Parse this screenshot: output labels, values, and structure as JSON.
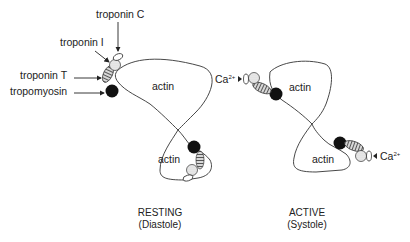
{
  "diagram": {
    "resting": {
      "caption_line1": "RESTING",
      "caption_line2": "(Diastole)",
      "actin_top": "actin",
      "actin_bottom": "actin",
      "labels": {
        "troponin_c": "troponin C",
        "troponin_i": "troponin I",
        "troponin_t": "troponin T",
        "tropomyosin": "tropomyosin"
      }
    },
    "active": {
      "caption_line1": "ACTIVE",
      "caption_line2": "(Systole)",
      "actin_top": "actin",
      "actin_bottom": "actin",
      "calcium_top": "Ca",
      "calcium_top_charge": "2+",
      "calcium_bottom": "Ca",
      "calcium_bottom_charge": "2+"
    },
    "colors": {
      "line": "#333333",
      "tropomyosin": "#111111",
      "troponin_c": "#ffffff",
      "troponin_i": "#e6e6e6",
      "troponin_t_hatch": "#777777"
    }
  }
}
